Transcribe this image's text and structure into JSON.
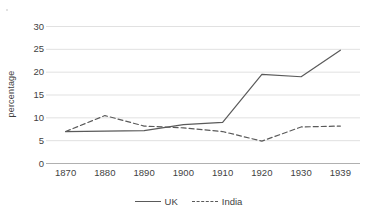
{
  "chart_data": {
    "type": "line",
    "title": "",
    "xlabel": "",
    "ylabel": "percentage",
    "categories": [
      "1870",
      "1880",
      "1890",
      "1900",
      "1910",
      "1920",
      "1930",
      "1939"
    ],
    "series": [
      {
        "name": "UK",
        "style": "solid",
        "color": "#5a5a5a",
        "values": [
          7,
          7.1,
          7.2,
          8.5,
          9,
          19.5,
          19,
          24.8
        ]
      },
      {
        "name": "India",
        "style": "dashed",
        "color": "#5a5a5a",
        "values": [
          7,
          10.5,
          8.2,
          7.8,
          7,
          4.9,
          8,
          8.2
        ]
      }
    ],
    "yticks": [
      0,
      5,
      10,
      15,
      20,
      25,
      30
    ],
    "ylim": [
      0,
      30
    ],
    "grid": true,
    "grid_axis": "y",
    "grid_color": "#d9d9d9",
    "legend_position": "bottom",
    "background": "#ffffff",
    "text_color": "#3f3f3f"
  }
}
